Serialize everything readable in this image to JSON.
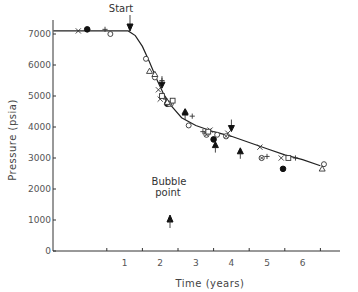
{
  "chart_data": {
    "type": "scatter",
    "title": "",
    "xlabel": "Time (years)",
    "ylabel": "Pressure (psia)",
    "xlim": [
      -1.0,
      7.5
    ],
    "ylim": [
      0,
      7500
    ],
    "x_ticks": [
      1,
      2,
      3,
      4,
      5,
      6
    ],
    "y_ticks": [
      0,
      1000,
      2000,
      3000,
      4000,
      5000,
      6000,
      7000
    ],
    "grid": false,
    "legend": null,
    "annotations": [
      {
        "text": "Start",
        "x": 1.15,
        "y": 7100,
        "arrow": "down"
      },
      {
        "text": "Bubble point",
        "x": 2.25,
        "y": 1000,
        "arrow": "up"
      }
    ],
    "fitted_curve": {
      "name": "Model",
      "points": [
        [
          -1.0,
          7100
        ],
        [
          0.6,
          7100
        ],
        [
          1.1,
          7100
        ],
        [
          1.3,
          6950
        ],
        [
          1.5,
          6600
        ],
        [
          1.7,
          6100
        ],
        [
          1.9,
          5550
        ],
        [
          2.1,
          5050
        ],
        [
          2.3,
          4700
        ],
        [
          2.6,
          4300
        ],
        [
          3.0,
          4050
        ],
        [
          3.5,
          3850
        ],
        [
          4.0,
          3700
        ],
        [
          4.5,
          3500
        ],
        [
          5.0,
          3300
        ],
        [
          5.5,
          3100
        ],
        [
          6.0,
          2950
        ],
        [
          6.5,
          2750
        ]
      ]
    },
    "series": [
      {
        "name": "x",
        "marker": "cross",
        "points": [
          [
            -0.3,
            7100
          ],
          [
            1.95,
            5200
          ],
          [
            2.0,
            4900
          ],
          [
            3.4,
            3900
          ],
          [
            3.9,
            3800
          ],
          [
            4.8,
            3350
          ],
          [
            5.4,
            3000
          ]
        ]
      },
      {
        "name": "+",
        "marker": "plus",
        "points": [
          [
            0.45,
            7150
          ],
          [
            2.05,
            5500
          ],
          [
            2.15,
            4900
          ],
          [
            2.9,
            4350
          ],
          [
            3.2,
            3850
          ],
          [
            5.0,
            3050
          ],
          [
            5.8,
            3000
          ]
        ]
      },
      {
        "name": "filled circle",
        "marker": "filled-circle",
        "points": [
          [
            -0.05,
            7150
          ],
          [
            2.2,
            4750
          ],
          [
            3.5,
            3600
          ],
          [
            5.45,
            2650
          ]
        ]
      },
      {
        "name": "open circle",
        "marker": "open-circle",
        "points": [
          [
            0.6,
            7000
          ],
          [
            1.6,
            6200
          ],
          [
            1.85,
            5600
          ],
          [
            2.3,
            4750
          ],
          [
            2.8,
            4050
          ],
          [
            3.3,
            3800
          ],
          [
            3.6,
            3750
          ],
          [
            6.6,
            2800
          ]
        ]
      },
      {
        "name": "circled x",
        "marker": "circled-cross",
        "points": [
          [
            2.25,
            4750
          ],
          [
            3.3,
            3750
          ],
          [
            3.85,
            3700
          ],
          [
            4.85,
            3000
          ]
        ]
      },
      {
        "name": "triangle",
        "marker": "open-triangle",
        "points": [
          [
            1.7,
            5800
          ],
          [
            1.85,
            5700
          ],
          [
            2.2,
            4800
          ],
          [
            2.7,
            4500
          ],
          [
            6.55,
            2650
          ]
        ]
      },
      {
        "name": "square",
        "marker": "open-square",
        "points": [
          [
            2.05,
            5000
          ],
          [
            2.35,
            4850
          ],
          [
            3.35,
            3850
          ],
          [
            5.6,
            3000
          ]
        ]
      },
      {
        "name": "filled arrow up",
        "marker": "arrow-up",
        "points": [
          [
            2.7,
            4450
          ],
          [
            3.55,
            3400
          ],
          [
            4.25,
            3200
          ]
        ]
      },
      {
        "name": "arrow down",
        "marker": "arrow-down",
        "points": [
          [
            2.05,
            5350
          ],
          [
            4.0,
            3950
          ]
        ]
      }
    ]
  },
  "labels": {
    "start": "Start",
    "bubble_line1": "Bubble",
    "bubble_line2": "point",
    "xlabel": "Time (years)",
    "ylabel": "Pressure (psia)"
  }
}
